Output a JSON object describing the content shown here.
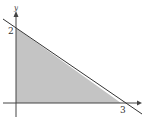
{
  "diagram": {
    "type": "feasible-region",
    "axis_labels": {
      "y": "y"
    },
    "intercepts": {
      "y_intercept_label": "2",
      "x_intercept_label": "3"
    },
    "line": {
      "from": [
        0,
        2
      ],
      "to": [
        3,
        0
      ]
    },
    "colors": {
      "fill": "#c4c4c4",
      "line": "#333333",
      "axis": "#444444"
    }
  }
}
